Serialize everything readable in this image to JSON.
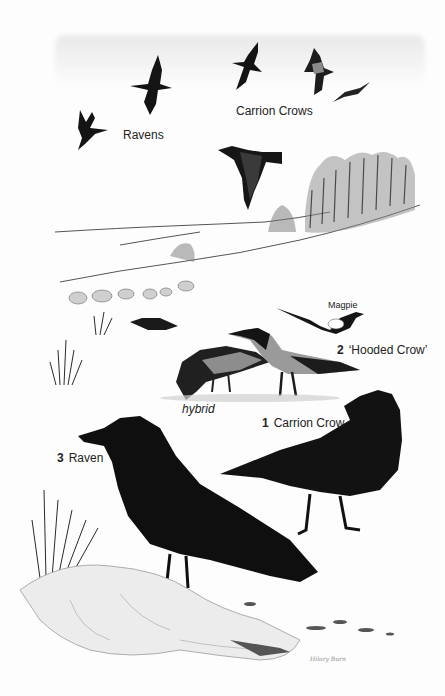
{
  "illustration": {
    "labels": {
      "ravens_flight": "Ravens",
      "carrion_crows_flight": "Carrion Crows",
      "magpie": "Magpie",
      "hooded_crow": {
        "num": "2",
        "text": "‘Hooded Crow’"
      },
      "hybrid": "hybrid",
      "carrion_crow": {
        "num": "1",
        "text": "Carrion Crow"
      },
      "raven": {
        "num": "3",
        "text": "Raven"
      }
    },
    "signature": "Hilary Burn",
    "colors": {
      "bird_black": "#141414",
      "hood_grey": "#9a9a9a",
      "snow": "#f6f6f6",
      "ink": "#222222"
    }
  }
}
